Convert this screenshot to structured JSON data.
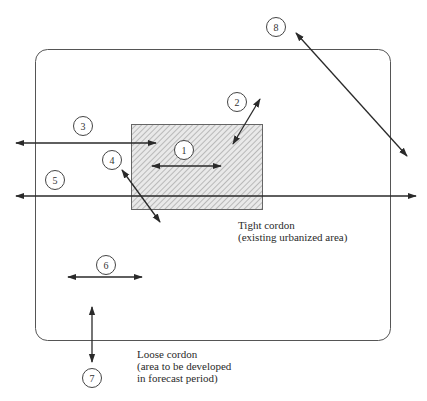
{
  "diagram": {
    "colors": {
      "line": "#3a3a3a",
      "outline": "#555555",
      "hatch_fill": "#e6e6e6",
      "hatch_line": "#8a8a8a",
      "text": "#2a2a2a"
    },
    "loose_cordon": {
      "label_line1": "Loose cordon",
      "label_line2": "(area to be developed",
      "label_line3": "in forecast period)"
    },
    "tight_cordon": {
      "label_line1": "Tight cordon",
      "label_line2": "(existing urbanized area)"
    },
    "trip_markers": [
      {
        "id": "1",
        "label": "1"
      },
      {
        "id": "2",
        "label": "2"
      },
      {
        "id": "3",
        "label": "3"
      },
      {
        "id": "4",
        "label": "4"
      },
      {
        "id": "5",
        "label": "5"
      },
      {
        "id": "6",
        "label": "6"
      },
      {
        "id": "7",
        "label": "7"
      },
      {
        "id": "8",
        "label": "8"
      }
    ]
  }
}
